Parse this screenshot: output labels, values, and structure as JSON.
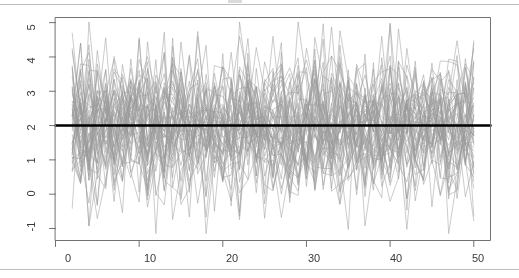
{
  "figure": {
    "title": "",
    "background_color": "#ffffff",
    "frame_color": "#6f7276",
    "series_color": "#9a9a9a",
    "reference_line_color": "#000000"
  },
  "chart_data": {
    "type": "line",
    "title": "",
    "subtitle": "",
    "xlabel": "",
    "ylabel": "",
    "xlim": [
      0,
      52
    ],
    "ylim": [
      -1.35,
      5.15
    ],
    "xticks": [
      0,
      10,
      20,
      30,
      40,
      50
    ],
    "xtick_labels": [
      "0",
      "10",
      "20",
      "30",
      "40",
      "50"
    ],
    "yticks": [
      -1,
      0,
      1,
      2,
      3,
      4,
      5
    ],
    "ytick_labels": [
      "-1",
      "0",
      "1",
      "2",
      "3",
      "4",
      "5"
    ],
    "grid": false,
    "legend": false,
    "legend_position": "none",
    "n_series": 50,
    "x_start": 2,
    "x_end": 50,
    "series_description": "50 simulated noisy sequences fluctuating about a mean level of 2",
    "series_mean": 2,
    "series_sd": 1,
    "observed_min": -1.15,
    "observed_max": 5.02,
    "reference_line": {
      "name": "mean level",
      "orientation": "horizontal",
      "value": 2,
      "linewidth": 2.5,
      "color": "#000000"
    },
    "annotations": []
  }
}
